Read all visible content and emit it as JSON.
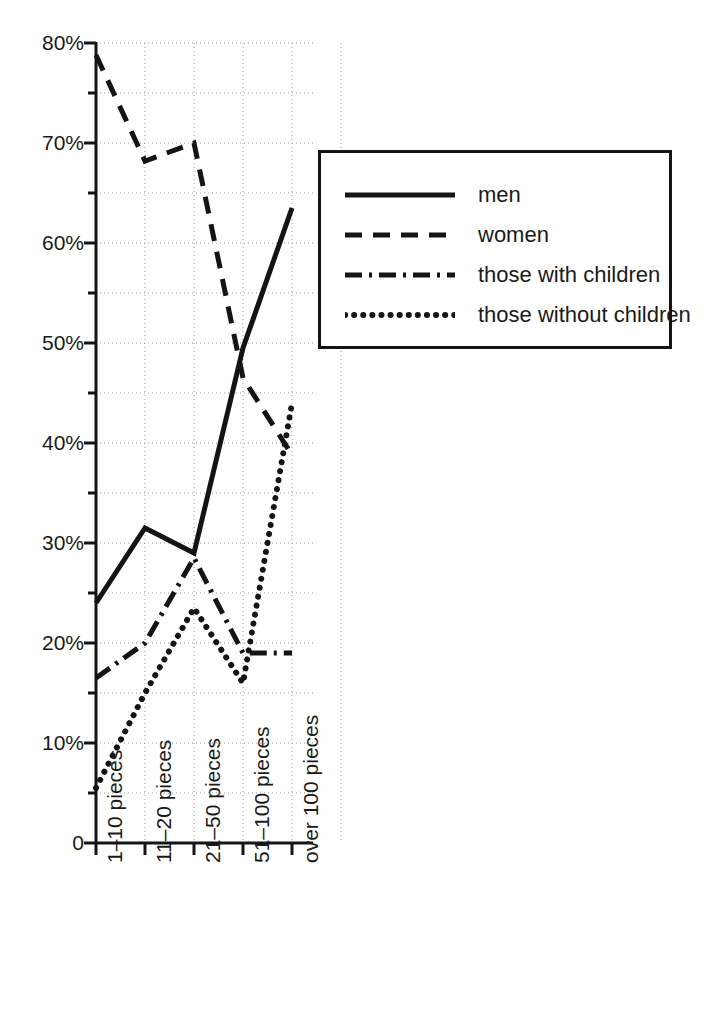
{
  "chart_data": {
    "type": "line",
    "title": "",
    "subtitle": "",
    "xlabel": "",
    "ylabel": "",
    "categories": [
      "1–10 pieces",
      "11–20 pieces",
      "21–50 pieces",
      "51–100 pieces",
      "over 100 pieces"
    ],
    "ytick_labels": [
      "0",
      "10%",
      "20%",
      "30%",
      "40%",
      "50%",
      "60%",
      "70%",
      "80%"
    ],
    "ytick_values": [
      0,
      10,
      20,
      30,
      40,
      50,
      60,
      70,
      80
    ],
    "ylim": [
      0,
      80
    ],
    "y_minor_step": 5,
    "grid": true,
    "grid_style": "dotted",
    "legend_position": "upper right",
    "series": [
      {
        "name": "men",
        "style": "solid",
        "values": [
          24.0,
          31.5,
          29.0,
          49.5,
          63.5
        ]
      },
      {
        "name": "women",
        "style": "dashed",
        "values": [
          78.8,
          68.2,
          70.0,
          46.5,
          38.8
        ]
      },
      {
        "name": "those with children",
        "style": "dashdot",
        "values": [
          16.5,
          20.0,
          28.5,
          19.0,
          19.0
        ]
      },
      {
        "name": "those without children",
        "style": "dotted",
        "values": [
          5.5,
          15.0,
          23.5,
          16.0,
          44.0
        ]
      }
    ],
    "legend_entries": [
      {
        "label": "men",
        "style": "solid"
      },
      {
        "label": "women",
        "style": "dashed"
      },
      {
        "label": "those with children",
        "style": "dashdot"
      },
      {
        "label": "those without children",
        "style": "dotted"
      }
    ],
    "colors": {
      "line": "#141414",
      "grid": "#9a9a9a",
      "axis": "#141414",
      "text": "#1a1a1a",
      "background": "#ffffff"
    }
  }
}
